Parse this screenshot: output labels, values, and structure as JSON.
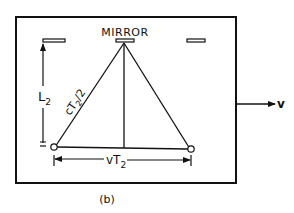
{
  "diagram": {
    "mirror_label": "MIRROR",
    "height_label_main": "L",
    "height_label_sub": "2",
    "hypotenuse_label_c": "c",
    "hypotenuse_label_T": "T",
    "hypotenuse_label_sub": "2",
    "hypotenuse_label_rest": "/2",
    "base_label_main": "vT",
    "base_label_sub": "2",
    "velocity_label": "v",
    "caption": "(b)"
  },
  "colors": {
    "ink": "#111111",
    "background": "#ffffff"
  }
}
